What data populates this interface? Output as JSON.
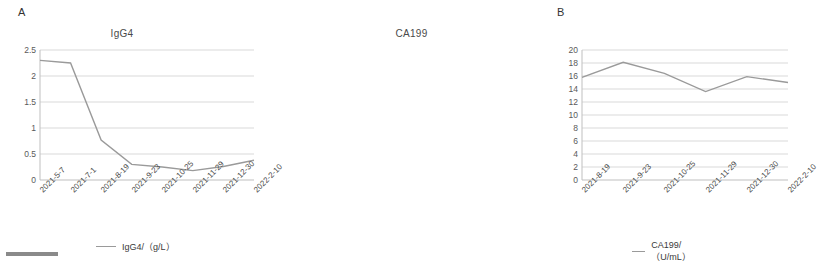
{
  "panels": {
    "a": {
      "letter": "A",
      "title": "IgG4"
    },
    "b": {
      "letter": "B",
      "title": "CA199"
    }
  },
  "legend": {
    "a": "IgG4/（g/L）",
    "b": "CA199/（U/mL）"
  },
  "chart_data": [
    {
      "type": "line",
      "panel": "A",
      "title": "IgG4",
      "xlabel": "",
      "ylabel": "",
      "categories": [
        "2021-5-7",
        "2021-7-1",
        "2021-8-19",
        "2021-9-23",
        "2021-10-25",
        "2021-11-29",
        "2021-12-30",
        "2022-2-10"
      ],
      "series": [
        {
          "name": "IgG4/（g/L）",
          "values": [
            2.3,
            2.25,
            0.77,
            0.3,
            0.25,
            0.18,
            0.26,
            0.38
          ]
        }
      ],
      "ylim": [
        0,
        2.5
      ],
      "yticks": [
        "0",
        "0.5",
        "1",
        "1.5",
        "2",
        "2.5"
      ],
      "grid": true,
      "legend_position": "bottom",
      "line_color": "#9a9a9a"
    },
    {
      "type": "line",
      "panel": "B",
      "title": "CA199",
      "xlabel": "",
      "ylabel": "",
      "categories": [
        "2021-8-19",
        "2021-9-23",
        "2021-10-25",
        "2021-11-29",
        "2021-12-30",
        "2022-2-10"
      ],
      "series": [
        {
          "name": "CA199/（U/mL）",
          "values": [
            15.8,
            18.1,
            16.4,
            13.6,
            15.9,
            15.0
          ]
        }
      ],
      "ylim": [
        0,
        20
      ],
      "yticks": [
        "0",
        "2",
        "4",
        "6",
        "8",
        "10",
        "12",
        "14",
        "16",
        "18",
        "20"
      ],
      "grid": true,
      "legend_position": "bottom",
      "line_color": "#9a9a9a"
    }
  ]
}
